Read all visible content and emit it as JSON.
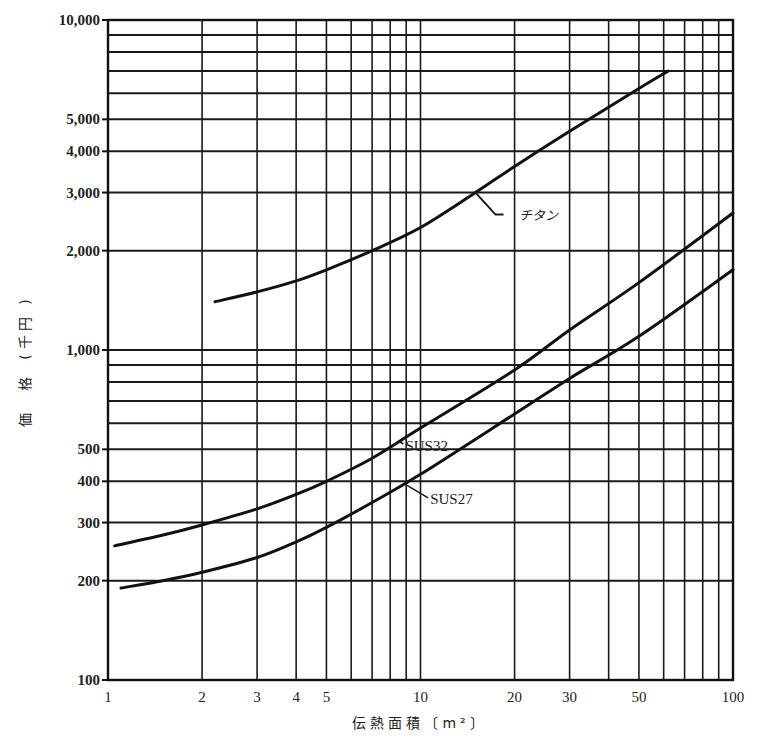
{
  "chart_data": {
    "type": "line",
    "title": "",
    "xlabel": "伝熱面積〔m²〕",
    "ylabel": "価格(千円)",
    "xscale": "log",
    "yscale": "log",
    "xlim": [
      1,
      100
    ],
    "ylim": [
      100,
      10000
    ],
    "grid": true,
    "legend": "inline-labels",
    "x_ticks": [
      1,
      2,
      3,
      4,
      5,
      10,
      20,
      30,
      50,
      100
    ],
    "x_tick_labels": [
      "1",
      "2",
      "3",
      "4",
      "5",
      "10",
      "20",
      "30",
      "50",
      "100"
    ],
    "y_ticks": [
      100,
      200,
      300,
      400,
      500,
      1000,
      2000,
      3000,
      4000,
      5000,
      10000
    ],
    "y_tick_labels": [
      "100",
      "200",
      "300",
      "400",
      "500",
      "1,000",
      "2,000",
      "3,000",
      "4,000",
      "5,000",
      "10,000"
    ],
    "x_gridlines": [
      1,
      2,
      3,
      4,
      5,
      6,
      7,
      8,
      9,
      10,
      20,
      30,
      40,
      50,
      60,
      70,
      80,
      90,
      100
    ],
    "y_gridlines": [
      100,
      200,
      300,
      400,
      500,
      600,
      700,
      800,
      900,
      1000,
      2000,
      3000,
      4000,
      5000,
      6000,
      7000,
      8000,
      9000,
      10000
    ],
    "series": [
      {
        "name": "チタン",
        "x": [
          2.2,
          3,
          4,
          5,
          7,
          10,
          15,
          20,
          30,
          50,
          62
        ],
        "values": [
          1400,
          1500,
          1620,
          1750,
          2000,
          2350,
          3000,
          3600,
          4600,
          6200,
          7000
        ],
        "label_anchor": [
          15,
          3000
        ],
        "label_pos": [
          20,
          2300
        ]
      },
      {
        "name": "SUS32",
        "x": [
          1.05,
          1.5,
          2,
          3,
          4,
          5,
          7,
          10,
          20,
          30,
          50,
          100
        ],
        "values": [
          255,
          275,
          295,
          330,
          365,
          400,
          470,
          580,
          870,
          1150,
          1600,
          2600
        ],
        "label_anchor": [
          8.5,
          530
        ],
        "label_pos": [
          9.5,
          540
        ]
      },
      {
        "name": "SUS27",
        "x": [
          1.1,
          1.5,
          2,
          3,
          4,
          5,
          7,
          10,
          20,
          30,
          50,
          100
        ],
        "values": [
          190,
          200,
          212,
          235,
          262,
          290,
          345,
          420,
          640,
          820,
          1100,
          1750
        ],
        "label_anchor": [
          9,
          390
        ],
        "label_pos": [
          11,
          370
        ]
      }
    ]
  },
  "labels": {
    "x_axis_title": "伝熱面積〔m²〕",
    "y_axis_title_chars": [
      "価",
      "格",
      "(",
      "千",
      "円",
      ")"
    ],
    "series_titanium": "チタン",
    "series_sus32": "SUS32",
    "series_sus27": "SUS27"
  }
}
